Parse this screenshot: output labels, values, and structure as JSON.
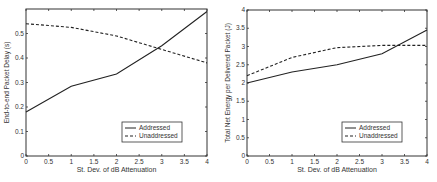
{
  "chart_data": [
    {
      "type": "line",
      "title": "",
      "xlabel": "St. Dev. of dB Attenuation",
      "ylabel": "End-to-end Packet Delay (s)",
      "xlim": [
        0,
        4
      ],
      "ylim": [
        0,
        0.6
      ],
      "xticks": [
        "0",
        "0.5",
        "1",
        "1.5",
        "2",
        "2.5",
        "3",
        "3.5",
        "4"
      ],
      "yticks": [
        "0",
        "0.1",
        "0.2",
        "0.3",
        "0.4",
        "0.5"
      ],
      "grid": false,
      "legend_position": "lower right",
      "x": [
        0,
        1,
        2,
        3,
        4
      ],
      "series": [
        {
          "name": "Addressed",
          "style": "solid",
          "values": [
            0.18,
            0.285,
            0.335,
            0.45,
            0.59
          ]
        },
        {
          "name": "Unaddressed",
          "style": "dashed",
          "values": [
            0.54,
            0.525,
            0.49,
            0.435,
            0.38
          ]
        }
      ]
    },
    {
      "type": "line",
      "title": "",
      "xlabel": "St. Dev. of dB Attenuation",
      "ylabel": "Total Net Energy per Delivered Packet (J)",
      "xlim": [
        0,
        4
      ],
      "ylim": [
        0,
        4
      ],
      "xticks": [
        "0",
        "0.5",
        "1",
        "1.5",
        "2",
        "2.5",
        "3",
        "3.5",
        "4"
      ],
      "yticks": [
        "0",
        "0.5",
        "1",
        "1.5",
        "2",
        "2.5",
        "3",
        "3.5",
        "4"
      ],
      "grid": false,
      "legend_position": "lower right",
      "x": [
        0,
        1,
        2,
        3,
        4
      ],
      "series": [
        {
          "name": "Addressed",
          "style": "solid",
          "values": [
            2.0,
            2.3,
            2.5,
            2.8,
            3.45
          ]
        },
        {
          "name": "Unaddressed",
          "style": "dashed",
          "values": [
            2.2,
            2.7,
            2.97,
            3.03,
            3.03
          ]
        }
      ]
    }
  ]
}
